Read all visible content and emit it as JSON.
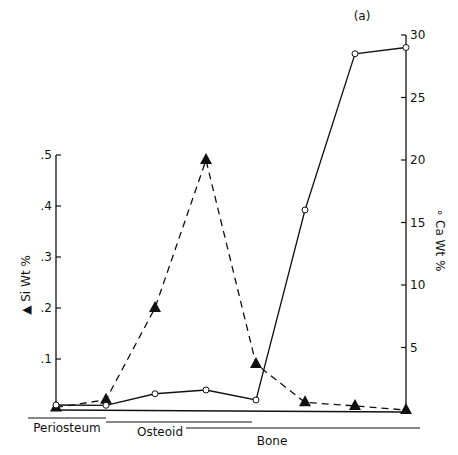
{
  "chart_data": {
    "type": "line",
    "panel_label": "(a)",
    "title": "",
    "x": [
      1,
      2,
      3,
      4,
      5,
      6,
      7,
      8
    ],
    "xlabel": "",
    "x_regions": [
      {
        "label": "Periosteum",
        "from": 1,
        "to": 2
      },
      {
        "label": "Osteoid",
        "from": 2,
        "to": 5
      },
      {
        "label": "Bone",
        "from": 4,
        "to": 8
      }
    ],
    "series": [
      {
        "name": "Si Wt %",
        "axis": "left",
        "marker": "filled-triangle",
        "line": "dashed",
        "values": [
          0.005,
          0.02,
          0.2,
          0.49,
          0.09,
          0.015,
          0.008,
          0.0
        ]
      },
      {
        "name": "Ca Wt %",
        "axis": "right",
        "marker": "open-circle",
        "line": "solid",
        "values": [
          0.3,
          0.3,
          1.3,
          1.6,
          0.8,
          16.0,
          28.5,
          29.0
        ]
      }
    ],
    "ylabel_left": "▲ Si Wt %",
    "ylim_left": [
      0,
      0.5
    ],
    "yticks_left": [
      ".1",
      ".2",
      ".3",
      ".4",
      ".5"
    ],
    "ylabel_right": "∘ Ca Wt %",
    "ylim_right": [
      0,
      30
    ],
    "yticks_right": [
      "5",
      "10",
      "15",
      "20",
      "25",
      "30"
    ],
    "grid": false,
    "legend": "none"
  }
}
